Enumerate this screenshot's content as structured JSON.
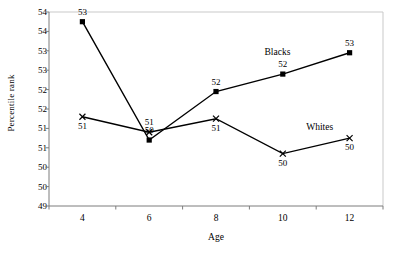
{
  "chart_data": {
    "type": "line",
    "title": "",
    "xlabel": "Age",
    "ylabel": "Percentile rank",
    "x": [
      4,
      6,
      8,
      10,
      12
    ],
    "xtick_labels": [
      "4",
      "6",
      "8",
      "10",
      "12"
    ],
    "xlim": [
      3,
      13
    ],
    "ylim": [
      49,
      54
    ],
    "ytick_values": [
      49,
      49.5,
      50,
      50.5,
      51,
      51.5,
      52,
      52.5,
      53,
      53.5,
      54
    ],
    "ytick_labels": [
      "49",
      "50",
      "50",
      "51",
      "51",
      "52",
      "52",
      "53",
      "53",
      "54",
      "54"
    ],
    "grid": false,
    "legend_position": "inline-annotations",
    "series": [
      {
        "name": "Blacks",
        "marker": "filled-square",
        "values": [
          53.75,
          50.7,
          51.95,
          52.4,
          52.95
        ],
        "data_labels": [
          "53",
          "50",
          "52",
          "52",
          "53"
        ],
        "data_label_positions": [
          "above",
          "above",
          "above",
          "above",
          "above"
        ]
      },
      {
        "name": "Whites",
        "marker": "x-cross",
        "values": [
          51.3,
          50.9,
          51.25,
          50.35,
          50.75
        ],
        "data_labels": [
          "51",
          "51",
          "51",
          "50",
          "50"
        ],
        "data_label_positions": [
          "below",
          "above",
          "below",
          "below",
          "below"
        ]
      }
    ],
    "annotations": [
      {
        "text": "Blacks",
        "x": 10.05,
        "y": 52.95
      },
      {
        "text": "Whites",
        "x": 11.3,
        "y": 51.02
      }
    ],
    "colors": {
      "line": "#000000",
      "marker": "#000000",
      "axis": "#808080",
      "text": "#000000",
      "background": "#ffffff"
    }
  }
}
